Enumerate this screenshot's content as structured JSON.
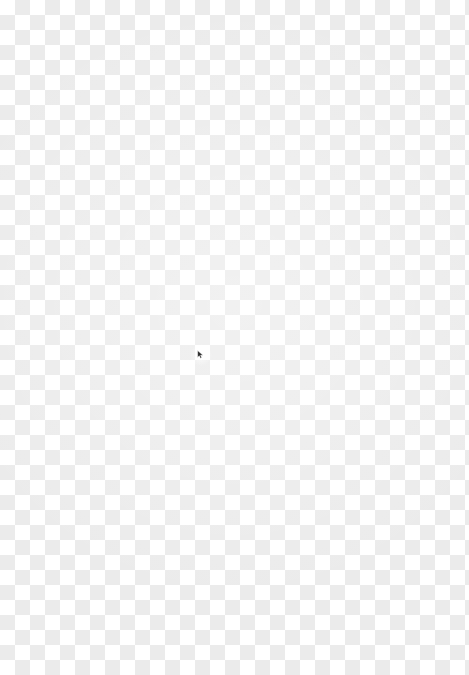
{
  "canvas": {
    "name": "Transparent image canvas",
    "width": 469,
    "height": 675,
    "background_kind": "transparency-checkerboard",
    "checker": {
      "tile_size_px": 15,
      "light_color": "#ffffff",
      "dark_color": "#ebebeb",
      "origin_tile": "light"
    },
    "content_text": "",
    "empty_state_label": ""
  },
  "cursor": {
    "visible": true,
    "kind": "mouse-pointer",
    "x": 197,
    "y": 350,
    "width": 7,
    "height": 9,
    "fill_color": "#2b2b2b",
    "outline_color": "#ffffff",
    "halo": true
  }
}
